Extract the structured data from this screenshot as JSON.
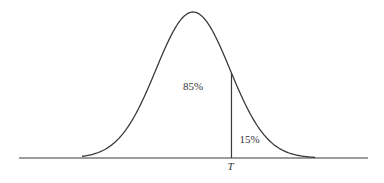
{
  "chart_data": {
    "type": "area",
    "title": "",
    "xlabel": "",
    "ylabel": "",
    "distribution": "normal",
    "mean": 0,
    "sd": 1,
    "xlim": [
      -3.5,
      3.5
    ],
    "threshold": {
      "label": "T",
      "z": 1.04
    },
    "regions": [
      {
        "name": "below-threshold",
        "label": "85%",
        "value": 85
      },
      {
        "name": "above-threshold",
        "label": "15%",
        "value": 15
      }
    ],
    "grid": false,
    "legend": "none"
  },
  "colors": {
    "line": "#3a3a3a",
    "text": "#333333",
    "background": "#ffffff"
  }
}
